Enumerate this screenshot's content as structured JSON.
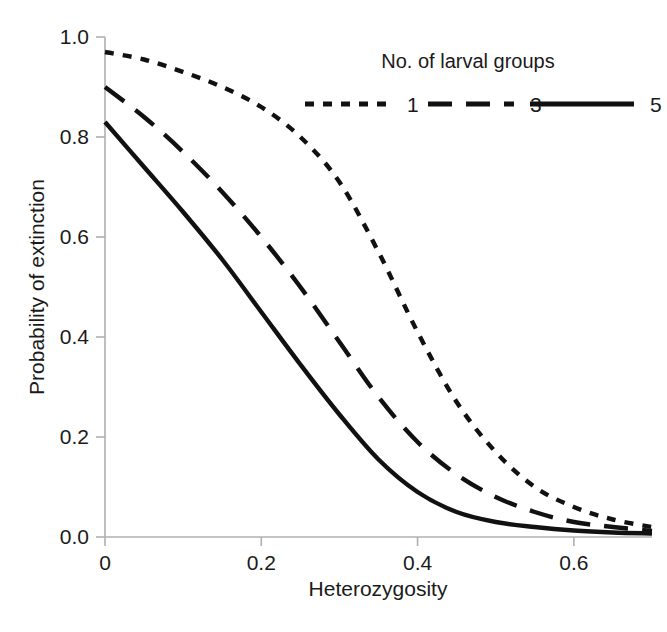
{
  "chart_data": {
    "type": "line",
    "title": "",
    "xlabel": "Heterozygosity",
    "ylabel": "Probability of extinction",
    "xlim": [
      0,
      0.7
    ],
    "ylim": [
      0.0,
      1.0
    ],
    "grid": false,
    "x_ticks": [
      "0",
      "0.2",
      "0.4",
      "0.6"
    ],
    "x_tick_values": [
      0,
      0.2,
      0.4,
      0.6
    ],
    "y_ticks": [
      "0.0",
      "0.2",
      "0.4",
      "0.6",
      "0.8",
      "1.0"
    ],
    "y_tick_values": [
      0.0,
      0.2,
      0.4,
      0.6,
      0.8,
      1.0
    ],
    "legend": {
      "title": "No. of larval groups",
      "position": "top-right",
      "entries": [
        {
          "label": "1",
          "style": "short-dash",
          "dasharray": "9,9"
        },
        {
          "label": "3",
          "style": "long-dash",
          "dasharray": "24,14"
        },
        {
          "label": "5",
          "style": "solid",
          "dasharray": "none"
        }
      ]
    },
    "x": [
      0,
      0.05,
      0.1,
      0.15,
      0.2,
      0.25,
      0.3,
      0.35,
      0.4,
      0.45,
      0.5,
      0.55,
      0.6,
      0.65,
      0.7
    ],
    "series": [
      {
        "name": "1",
        "style": "short-dash",
        "values": [
          0.97,
          0.955,
          0.93,
          0.9,
          0.86,
          0.8,
          0.71,
          0.57,
          0.41,
          0.27,
          0.17,
          0.1,
          0.06,
          0.035,
          0.02
        ]
      },
      {
        "name": "3",
        "style": "long-dash",
        "values": [
          0.9,
          0.84,
          0.77,
          0.69,
          0.6,
          0.5,
          0.39,
          0.28,
          0.19,
          0.125,
          0.08,
          0.05,
          0.03,
          0.02,
          0.012
        ]
      },
      {
        "name": "5",
        "style": "solid",
        "values": [
          0.83,
          0.74,
          0.65,
          0.555,
          0.45,
          0.345,
          0.245,
          0.155,
          0.09,
          0.05,
          0.03,
          0.02,
          0.013,
          0.009,
          0.007
        ]
      }
    ]
  },
  "colors": {
    "line": "#111111",
    "axis": "#b0b0b0",
    "text": "#1a1a1a",
    "background": "#ffffff"
  }
}
